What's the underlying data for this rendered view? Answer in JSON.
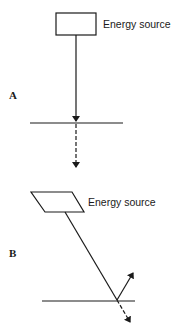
{
  "diagram": {
    "panels": [
      {
        "id": "A",
        "label": "A",
        "source_label": "Energy source",
        "description": "Vertical incidence: energy passes straight through surface"
      },
      {
        "id": "B",
        "label": "B",
        "source_label": "Energy source",
        "description": "Oblique incidence: energy partly reflected and partly transmitted"
      }
    ],
    "colors": {
      "stroke": "#1a1a1a",
      "background": "#ffffff"
    }
  }
}
